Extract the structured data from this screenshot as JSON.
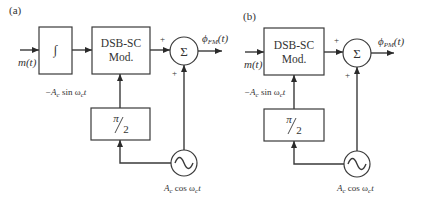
{
  "diagrams": [
    {
      "panel_label": "(a)",
      "input_label": "m(t)",
      "integrator": {
        "symbol": "∫"
      },
      "modulator": {
        "line1": "DSB-SC",
        "line2": "Mod."
      },
      "modulator_carrier_label": {
        "prefix": "−A",
        "sub_c": "c",
        "mid": " sin ω",
        "sub_c2": "c",
        "suffix": "t"
      },
      "phase_shifter": {
        "num": "π",
        "den": "2"
      },
      "summer": {
        "symbol": "Σ",
        "plus_top": "+",
        "plus_bottom": "+"
      },
      "output_label": {
        "phi": "ϕ",
        "sub": "FM",
        "arg": "(t)"
      },
      "oscillator_label": {
        "prefix": "A",
        "sub_c": "c",
        "mid": " cos ω",
        "sub_c2": "c",
        "suffix": "t"
      }
    },
    {
      "panel_label": "(b)",
      "input_label": "m(t)",
      "modulator": {
        "line1": "DSB-SC",
        "line2": "Mod."
      },
      "modulator_carrier_label": {
        "prefix": "−A",
        "sub_c": "c",
        "mid": " sin ω",
        "sub_c2": "c",
        "suffix": "t"
      },
      "phase_shifter": {
        "num": "π",
        "den": "2"
      },
      "summer": {
        "symbol": "Σ",
        "plus_top": "+",
        "plus_bottom": "+"
      },
      "output_label": {
        "phi": "ϕ",
        "sub": "PM",
        "arg": "(t)"
      },
      "oscillator_label": {
        "prefix": "A",
        "sub_c": "c",
        "mid": " cos ω",
        "sub_c2": "c",
        "suffix": "t"
      }
    }
  ]
}
